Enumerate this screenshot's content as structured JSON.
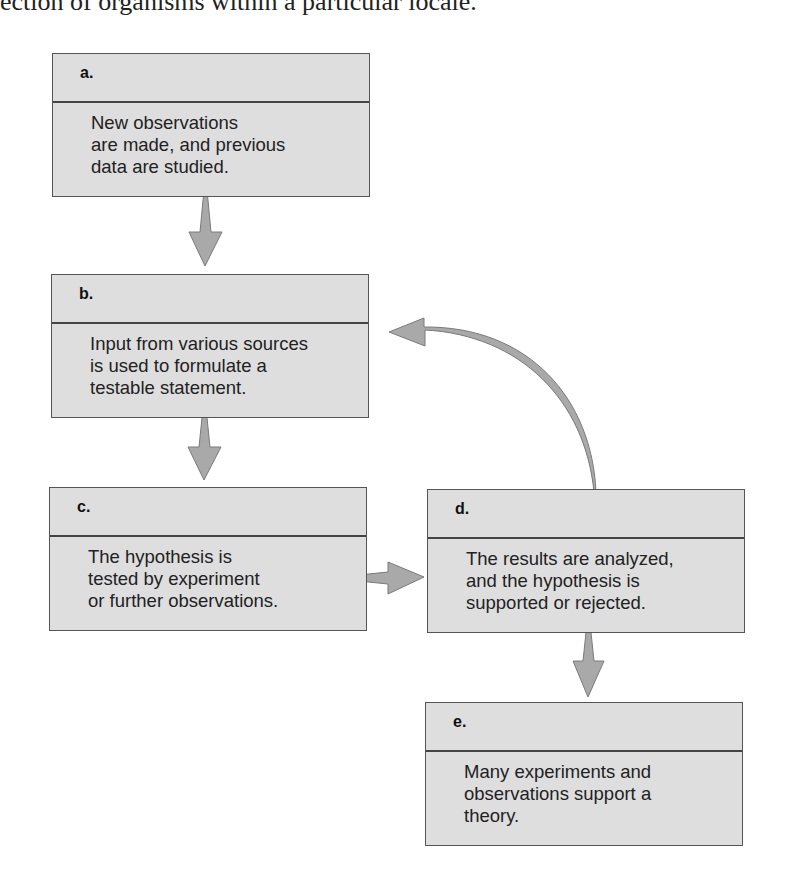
{
  "caption": "ection of organisms within a particular locale.",
  "steps": [
    {
      "label": "a.",
      "text": "New observations\nare made, and previous\ndata are studied."
    },
    {
      "label": "b.",
      "text": "Input from various sources\nis used to formulate a\ntestable statement."
    },
    {
      "label": "c.",
      "text": "The hypothesis is\ntested by experiment\nor further observations."
    },
    {
      "label": "d.",
      "text": "The results are analyzed,\nand the hypothesis is\nsupported or rejected."
    },
    {
      "label": "e.",
      "text": "Many experiments and\nobservations support a\ntheory."
    }
  ],
  "colors": {
    "box_fill": "#dedede",
    "arrow_fill": "#a9a9a9",
    "arrow_stroke": "#7a7a7a"
  },
  "connections": [
    {
      "from": "a",
      "to": "b"
    },
    {
      "from": "b",
      "to": "c"
    },
    {
      "from": "c",
      "to": "d"
    },
    {
      "from": "d",
      "to": "b",
      "style": "curved"
    },
    {
      "from": "d",
      "to": "e"
    }
  ]
}
